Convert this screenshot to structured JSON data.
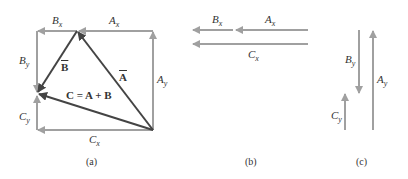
{
  "colors": {
    "component": "#a0a0a0",
    "vector": "#444444",
    "text": "#333333"
  },
  "panels": {
    "a": {
      "caption": "(a)",
      "labels": {
        "Bx": {
          "main": "B",
          "sub": "x"
        },
        "Ax": {
          "main": "A",
          "sub": "x"
        },
        "By": {
          "main": "B",
          "sub": "y"
        },
        "Ay": {
          "main": "A",
          "sub": "y"
        },
        "Cy": {
          "main": "C",
          "sub": "y"
        },
        "Cx": {
          "main": "C",
          "sub": "x"
        },
        "B": "B",
        "A": "A",
        "C_eq": "C = A + B"
      }
    },
    "b": {
      "caption": "(b)",
      "labels": {
        "Bx": {
          "main": "B",
          "sub": "x"
        },
        "Ax": {
          "main": "A",
          "sub": "x"
        },
        "Cx": {
          "main": "C",
          "sub": "x"
        }
      }
    },
    "c": {
      "caption": "(c)",
      "labels": {
        "By": {
          "main": "B",
          "sub": "y"
        },
        "Ay": {
          "main": "A",
          "sub": "y"
        },
        "Cy": {
          "main": "C",
          "sub": "y"
        }
      }
    }
  }
}
